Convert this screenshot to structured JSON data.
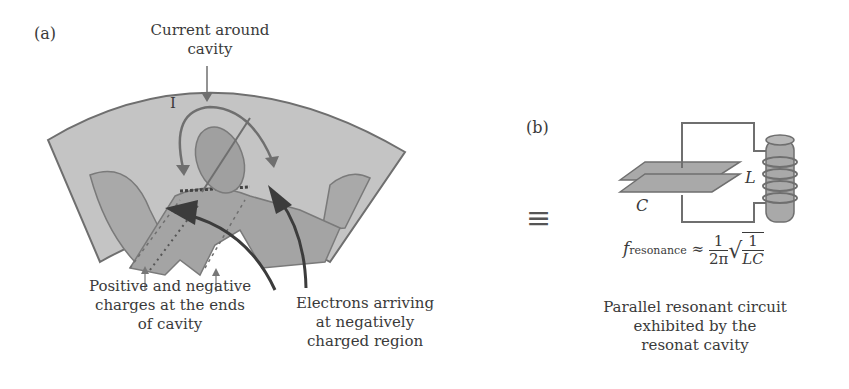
{
  "panel_a": {
    "label": "(a)",
    "current_label_line1": "Current around",
    "current_label_line2": "cavity",
    "current_symbol": "I",
    "charges_label_line1": "Positive and negative",
    "charges_label_line2": "charges at the ends",
    "charges_label_line3": "of cavity",
    "electrons_label_line1": "Electrons arriving",
    "electrons_label_line2": "at negatively",
    "electrons_label_line3": "charged region"
  },
  "equivalence_symbol": "≡",
  "panel_b": {
    "label": "(b)",
    "capacitor_label": "C",
    "inductor_label": "L",
    "formula": {
      "f": "f",
      "subscript": "resonance",
      "approx": "≈",
      "frac1_num": "1",
      "frac1_den": "2π",
      "frac2_num": "1",
      "frac2_den": "LC"
    },
    "caption_line1": "Parallel resonant circuit",
    "caption_line2": "exhibited by the",
    "caption_line3": "resonat cavity"
  },
  "colors": {
    "outer_fill": "#c4c4c4",
    "mid_fill": "#a9a9a9",
    "dark_fill": "#8e8e8e",
    "stroke": "#6f6f6f",
    "arrow_dark": "#3c3c3c",
    "text": "#3a3a3a"
  }
}
